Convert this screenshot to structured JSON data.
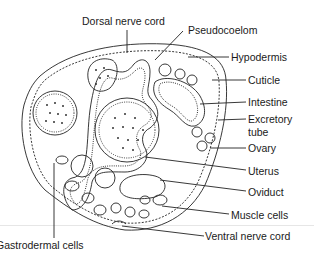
{
  "figure": {
    "labels": [
      {
        "id": "dorsal-nerve-cord",
        "text": "Dorsal nerve cord",
        "x": 82,
        "y": 16
      },
      {
        "id": "pseudocoelom",
        "text": "Pseudocoelom",
        "x": 188,
        "y": 25
      },
      {
        "id": "hypodermis",
        "text": "Hypodermis",
        "x": 231,
        "y": 52
      },
      {
        "id": "cuticle",
        "text": "Cuticle",
        "x": 248,
        "y": 75
      },
      {
        "id": "intestine",
        "text": "Intestine",
        "x": 248,
        "y": 97
      },
      {
        "id": "excretory-tube-1",
        "text": "Excretory",
        "x": 248,
        "y": 114
      },
      {
        "id": "excretory-tube-2",
        "text": "tube",
        "x": 248,
        "y": 127
      },
      {
        "id": "ovary",
        "text": "Ovary",
        "x": 248,
        "y": 143
      },
      {
        "id": "uterus",
        "text": "Uterus",
        "x": 248,
        "y": 166
      },
      {
        "id": "oviduct",
        "text": "Oviduct",
        "x": 248,
        "y": 187
      },
      {
        "id": "muscle-cells",
        "text": "Muscle cells",
        "x": 231,
        "y": 210
      },
      {
        "id": "ventral-nerve-cord",
        "text": "Ventral nerve cord",
        "x": 205,
        "y": 231
      },
      {
        "id": "gastrodermal-cells",
        "text": "Gastrodermal cells",
        "x": 0,
        "y": 240
      }
    ],
    "colors": {
      "line": "#222222",
      "fill": "#ffffff",
      "divider": "#e6e6e6"
    }
  }
}
